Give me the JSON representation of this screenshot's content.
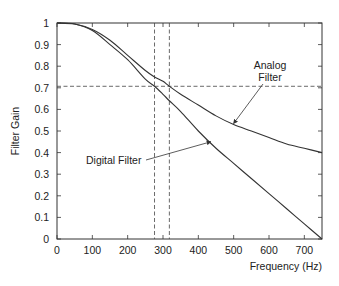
{
  "chart_data": {
    "type": "line",
    "title": "",
    "xlabel": "Frequency (Hz)",
    "ylabel": "Filter Gain",
    "xlim": [
      0,
      750
    ],
    "ylim": [
      0,
      1
    ],
    "grid": false,
    "legend": "none (inline annotations)",
    "x_ticks": [
      0,
      100,
      200,
      300,
      400,
      500,
      600,
      700
    ],
    "y_ticks": [
      0,
      0.1,
      0.2,
      0.3,
      0.4,
      0.5,
      0.6,
      0.7,
      0.8,
      0.9,
      1
    ],
    "x_tick_labels": [
      "0",
      "100",
      "200",
      "300",
      "400",
      "500",
      "600",
      "700"
    ],
    "y_tick_labels": [
      "0",
      "0.1",
      "0.2",
      "0.3",
      "0.4",
      "0.5",
      "0.6",
      "0.7",
      "0.8",
      "0.9",
      "1"
    ],
    "x": [
      0,
      50,
      100,
      150,
      200,
      250,
      276,
      300,
      318,
      350,
      400,
      450,
      500,
      550,
      600,
      650,
      700,
      750
    ],
    "series": [
      {
        "name": "Analog Filter",
        "values": [
          1.0,
          0.995,
          0.97,
          0.92,
          0.85,
          0.78,
          0.75,
          0.73,
          0.707,
          0.67,
          0.62,
          0.57,
          0.53,
          0.5,
          0.47,
          0.44,
          0.42,
          0.4
        ]
      },
      {
        "name": "Digital Filter",
        "values": [
          1.0,
          0.995,
          0.965,
          0.9,
          0.83,
          0.74,
          0.707,
          0.67,
          0.64,
          0.59,
          0.5,
          0.42,
          0.35,
          0.28,
          0.21,
          0.14,
          0.07,
          0.0
        ]
      }
    ],
    "reference_lines": {
      "horizontal": [
        {
          "y": 0.707,
          "style": "dashed"
        }
      ],
      "vertical": [
        {
          "x": 276,
          "style": "dashed"
        },
        {
          "x": 318,
          "style": "dashed"
        }
      ]
    },
    "annotations": [
      {
        "text_lines": [
          "Analog",
          "Filter"
        ],
        "points_to": "Analog Filter",
        "arrow_target": [
          500,
          0.535
        ]
      },
      {
        "text_lines": [
          "Digital Filter"
        ],
        "points_to": "Digital Filter",
        "arrow_target": [
          435,
          0.45
        ]
      }
    ]
  }
}
